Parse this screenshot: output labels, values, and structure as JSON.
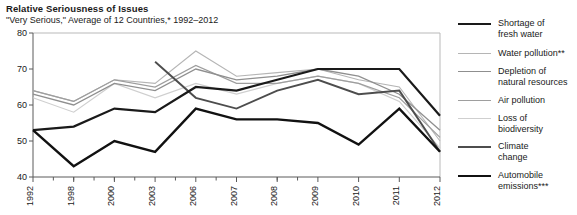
{
  "header": {
    "title": "Relative Seriousness of Issues",
    "subtitle": "\"Very Serious,\" Average of 12 Countries,* 1992–2012"
  },
  "legend": {
    "position": "right",
    "items": [
      {
        "label": "Shortage of\nfresh water",
        "color": "#1a1a1a",
        "width": 2.2
      },
      {
        "label": "Water pollution**",
        "color": "#b5b5b5",
        "width": 1.1
      },
      {
        "label": "Depletion of\nnatural resources",
        "color": "#8f8f8f",
        "width": 1.3
      },
      {
        "label": "Air pollution",
        "color": "#9e9e9e",
        "width": 1.2
      },
      {
        "label": "Loss of\nbiodiversity",
        "color": "#cfcfcf",
        "width": 1.2
      },
      {
        "label": "Climate\nchange",
        "color": "#4d4d4d",
        "width": 1.9
      },
      {
        "label": "Automobile\nemissions***",
        "color": "#111111",
        "width": 2.4
      }
    ]
  },
  "chart_data": {
    "type": "line",
    "title": "Relative Seriousness of Issues",
    "subtitle": "\"Very Serious,\" Average of 12 Countries,* 1992–2012",
    "xlabel": "",
    "ylabel": "",
    "ylim": [
      40,
      80
    ],
    "yticks": [
      40,
      50,
      60,
      70,
      80
    ],
    "grid": false,
    "x": [
      1992,
      1998,
      2000,
      2003,
      2006,
      2007,
      2008,
      2009,
      2010,
      2011,
      2012
    ],
    "xtick_labels": [
      "1992",
      "1998",
      "2000",
      "2003",
      "2006",
      "2007",
      "2008",
      "2009",
      "2010",
      "2011",
      "2012"
    ],
    "series": [
      {
        "name": "Shortage of fresh water",
        "color": "#1a1a1a",
        "width": 2.2,
        "values": [
          53,
          54,
          59,
          58,
          65,
          64,
          67,
          70,
          70,
          70,
          57
        ]
      },
      {
        "name": "Water pollution**",
        "color": "#b5b5b5",
        "width": 1.1,
        "values": [
          64,
          61,
          67,
          66,
          75,
          68,
          69,
          70,
          67,
          65,
          50
        ]
      },
      {
        "name": "Depletion of natural resources",
        "color": "#8f8f8f",
        "width": 1.3,
        "values": [
          63,
          60,
          66,
          64,
          70,
          67,
          68,
          70,
          68,
          63,
          53
        ]
      },
      {
        "name": "Air pollution",
        "color": "#9e9e9e",
        "width": 1.2,
        "values": [
          64,
          61,
          67,
          65,
          71,
          66,
          66,
          68,
          66,
          62,
          51
        ]
      },
      {
        "name": "Loss of biodiversity",
        "color": "#cfcfcf",
        "width": 1.2,
        "values": [
          62,
          58,
          66,
          62,
          66,
          63,
          66,
          68,
          66,
          61,
          48
        ]
      },
      {
        "name": "Climate change",
        "color": "#4d4d4d",
        "width": 1.9,
        "values": [
          null,
          null,
          null,
          72,
          62,
          59,
          64,
          67,
          63,
          64,
          47
        ]
      },
      {
        "name": "Automobile emissions***",
        "color": "#111111",
        "width": 2.4,
        "values": [
          53,
          43,
          50,
          47,
          59,
          56,
          56,
          55,
          49,
          59,
          47
        ]
      }
    ]
  }
}
